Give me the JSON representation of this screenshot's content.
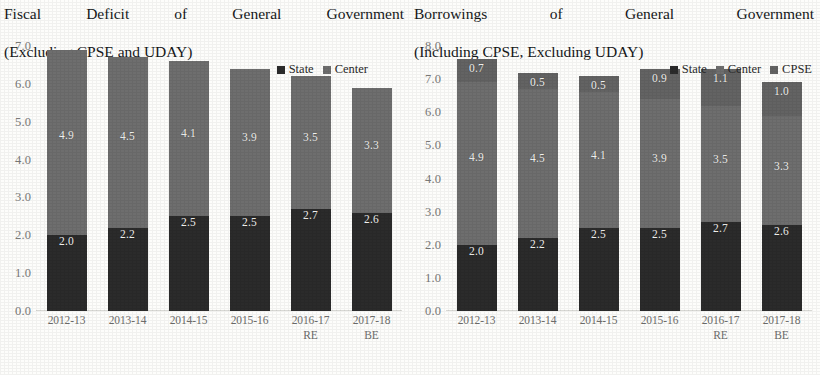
{
  "chart_data": [
    {
      "type": "bar",
      "stacked": true,
      "title": "Fiscal Deficit of General Government (Excluding CPSE and UDAY)",
      "title_line1": "Fiscal Deficit of General Government",
      "title_line2": "(Excluding CPSE and UDAY)",
      "xlabel": "",
      "ylabel": "",
      "ylim": [
        0.0,
        7.0
      ],
      "ytick_step": 1.0,
      "yticks": [
        "7.0",
        "6.0",
        "5.0",
        "4.0",
        "3.0",
        "2.0",
        "1.0",
        "0.0"
      ],
      "grid": false,
      "legend_position": "top-right",
      "categories": [
        "2012-13",
        "2013-14",
        "2014-15",
        "2015-16",
        "2016-17",
        "2017-18"
      ],
      "category_sublabels": [
        "",
        "",
        "",
        "",
        "RE",
        "BE"
      ],
      "series": [
        {
          "name": "State",
          "values": [
            2.0,
            2.2,
            2.5,
            2.5,
            2.7,
            2.6
          ],
          "color": "#2b2b2b"
        },
        {
          "name": "Center",
          "values": [
            4.9,
            4.5,
            4.1,
            3.9,
            3.5,
            3.3
          ],
          "color": "#6e6e6e"
        }
      ],
      "totals": [
        6.9,
        6.7,
        6.6,
        6.4,
        6.2,
        5.9
      ]
    },
    {
      "type": "bar",
      "stacked": true,
      "title": "Borrowings of General Government (Including CPSE, Excluding UDAY)",
      "title_line1": "Borrowings of General Government",
      "title_line2": "(Including CPSE, Excluding UDAY)",
      "xlabel": "",
      "ylabel": "",
      "ylim": [
        0.0,
        8.0
      ],
      "ytick_step": 1.0,
      "yticks": [
        "8.0",
        "7.0",
        "6.0",
        "5.0",
        "4.0",
        "3.0",
        "2.0",
        "1.0",
        "0.0"
      ],
      "grid": false,
      "legend_position": "top-right",
      "categories": [
        "2012-13",
        "2013-14",
        "2014-15",
        "2015-16",
        "2016-17",
        "2017-18"
      ],
      "category_sublabels": [
        "",
        "",
        "",
        "",
        "RE",
        "BE"
      ],
      "series": [
        {
          "name": "State",
          "values": [
            2.0,
            2.2,
            2.5,
            2.5,
            2.7,
            2.6
          ],
          "color": "#2b2b2b"
        },
        {
          "name": "Center",
          "values": [
            4.9,
            4.5,
            4.1,
            3.9,
            3.5,
            3.3
          ],
          "color": "#6e6e6e"
        },
        {
          "name": "CPSE",
          "values": [
            0.7,
            0.5,
            0.5,
            0.9,
            1.1,
            1.0
          ],
          "color": "#636363"
        }
      ],
      "totals": [
        7.6,
        7.2,
        7.1,
        7.3,
        7.3,
        6.9
      ]
    }
  ],
  "left": {
    "title_line1": "Fiscal Deficit of General Government",
    "title_line2": "(Excluding CPSE and UDAY)",
    "yticks": [
      "7.0",
      "6.0",
      "5.0",
      "4.0",
      "3.0",
      "2.0",
      "1.0",
      "0.0"
    ],
    "legend": [
      {
        "label": "State",
        "color": "#2b2b2b"
      },
      {
        "label": "Center",
        "color": "#6e6e6e"
      }
    ],
    "categories": [
      {
        "label": "2012-13",
        "sub": ""
      },
      {
        "label": "2013-14",
        "sub": ""
      },
      {
        "label": "2014-15",
        "sub": ""
      },
      {
        "label": "2015-16",
        "sub": ""
      },
      {
        "label": "2016-17",
        "sub": "RE"
      },
      {
        "label": "2017-18",
        "sub": "BE"
      }
    ],
    "bars": [
      {
        "state": "2.0",
        "center": "4.9"
      },
      {
        "state": "2.2",
        "center": "4.5"
      },
      {
        "state": "2.5",
        "center": "4.1"
      },
      {
        "state": "2.5",
        "center": "3.9"
      },
      {
        "state": "2.7",
        "center": "3.5"
      },
      {
        "state": "2.6",
        "center": "3.3"
      }
    ]
  },
  "right": {
    "title_line1": "Borrowings of General Government",
    "title_line2": "(Including CPSE, Excluding UDAY)",
    "yticks": [
      "8.0",
      "7.0",
      "6.0",
      "5.0",
      "4.0",
      "3.0",
      "2.0",
      "1.0",
      "0.0"
    ],
    "legend": [
      {
        "label": "State",
        "color": "#2b2b2b"
      },
      {
        "label": "Center",
        "color": "#6e6e6e"
      },
      {
        "label": "CPSE",
        "color": "#636363"
      }
    ],
    "categories": [
      {
        "label": "2012-13",
        "sub": ""
      },
      {
        "label": "2013-14",
        "sub": ""
      },
      {
        "label": "2014-15",
        "sub": ""
      },
      {
        "label": "2015-16",
        "sub": ""
      },
      {
        "label": "2016-17",
        "sub": "RE"
      },
      {
        "label": "2017-18",
        "sub": "BE"
      }
    ],
    "bars": [
      {
        "state": "2.0",
        "center": "4.9",
        "cpse": "0.7"
      },
      {
        "state": "2.2",
        "center": "4.5",
        "cpse": "0.5"
      },
      {
        "state": "2.5",
        "center": "4.1",
        "cpse": "0.5"
      },
      {
        "state": "2.5",
        "center": "3.9",
        "cpse": "0.9"
      },
      {
        "state": "2.7",
        "center": "3.5",
        "cpse": "1.1"
      },
      {
        "state": "2.6",
        "center": "3.3",
        "cpse": "1.0"
      }
    ]
  }
}
